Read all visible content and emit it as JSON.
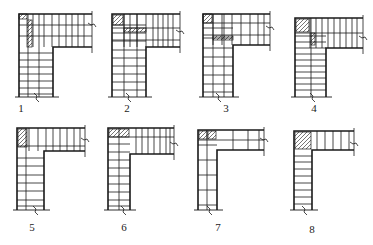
{
  "diagram": {
    "stroke_color": "#1a1a1a",
    "background": "#ffffff",
    "figures": [
      {
        "label": "1",
        "label_pos": [
          21,
          108
        ],
        "outer": {
          "x0": 19,
          "y0": 14,
          "right": 92,
          "stem_right": 53,
          "arm_bottom": 47,
          "bottom": 97
        },
        "wall_thickness": {
          "vertical": 34,
          "horizontal": 33
        },
        "arm_rows": [
          25,
          36
        ],
        "arm_cols": [
          33,
          44,
          52,
          59,
          66,
          72,
          78,
          84
        ],
        "stem_rows": [
          53,
          60,
          67,
          74,
          81,
          88,
          94
        ],
        "stem_cols": [
          28,
          39
        ],
        "hatch": [
          {
            "x": 19,
            "y": 14,
            "w": 8,
            "h": 5
          },
          {
            "x": 27,
            "y": 20,
            "w": 5,
            "h": 27
          }
        ],
        "break_bottom_x": 37,
        "break_right_y": 25
      },
      {
        "label": "2",
        "label_pos": [
          127,
          108
        ],
        "outer": {
          "x0": 112,
          "y0": 14,
          "right": 180,
          "stem_right": 146,
          "arm_bottom": 47,
          "bottom": 97
        },
        "wall_thickness": {
          "vertical": 34,
          "horizontal": 33
        },
        "arm_rows": [
          28,
          40
        ],
        "arm_cols": [
          124,
          130,
          137,
          146,
          153,
          158,
          163,
          168,
          173
        ],
        "stem_rows": [
          25,
          33,
          41,
          50,
          58,
          66,
          74,
          82,
          90
        ],
        "stem_cols": [
          124,
          137
        ],
        "hatch": [
          {
            "x": 113,
            "y": 15,
            "w": 10,
            "h": 10
          },
          {
            "x": 124,
            "y": 28,
            "w": 22,
            "h": 4
          }
        ],
        "break_bottom_x": 129,
        "break_right_y": 32
      },
      {
        "label": "3",
        "label_pos": [
          226,
          108
        ],
        "outer": {
          "x0": 203,
          "y0": 14,
          "right": 270,
          "stem_right": 233,
          "arm_bottom": 45,
          "bottom": 97
        },
        "wall_thickness": {
          "vertical": 30,
          "horizontal": 31
        },
        "arm_rows": [
          23,
          35
        ],
        "arm_cols": [
          213,
          222,
          232,
          241,
          250,
          258,
          264
        ],
        "stem_rows": [
          28,
          38,
          48,
          57,
          66,
          75,
          84,
          92
        ],
        "stem_cols": [
          213,
          224
        ],
        "hatch": [
          {
            "x": 203,
            "y": 14,
            "w": 9,
            "h": 9
          },
          {
            "x": 213,
            "y": 36,
            "w": 20,
            "h": 4
          }
        ],
        "break_bottom_x": 219,
        "break_right_y": 28
      },
      {
        "label": "4",
        "label_pos": [
          314,
          108
        ],
        "outer": {
          "x0": 295,
          "y0": 18,
          "right": 363,
          "stem_right": 326,
          "arm_bottom": 48,
          "bottom": 97
        },
        "wall_thickness": {
          "vertical": 31,
          "horizontal": 30
        },
        "arm_rows": [
          33
        ],
        "arm_cols": [
          310,
          316,
          322,
          328,
          334,
          340,
          346,
          352,
          357
        ],
        "stem_rows": [
          36,
          42,
          48,
          54,
          60,
          66,
          72,
          78,
          84,
          90
        ],
        "stem_cols": [
          311
        ],
        "hatch": [
          {
            "x": 296,
            "y": 19,
            "w": 13,
            "h": 13
          },
          {
            "x": 311,
            "y": 33,
            "w": 4,
            "h": 12
          }
        ],
        "break_bottom_x": 313,
        "break_right_y": 38
      },
      {
        "label": "5",
        "label_pos": [
          32,
          227
        ],
        "outer": {
          "x0": 17,
          "y0": 128,
          "right": 85,
          "stem_right": 44,
          "arm_bottom": 151,
          "bottom": 210
        },
        "wall_thickness": {
          "vertical": 27,
          "horizontal": 23
        },
        "arm_rows": [
          146
        ],
        "arm_cols": [
          29,
          38,
          46,
          53,
          60,
          67,
          74,
          80
        ],
        "stem_rows": [
          158,
          166,
          175,
          183,
          191,
          200,
          206
        ],
        "stem_cols": [
          26
        ],
        "hatch": [
          {
            "x": 18,
            "y": 129,
            "w": 9,
            "h": 18
          }
        ],
        "break_bottom_x": 36,
        "break_right_y": 140
      },
      {
        "label": "6",
        "label_pos": [
          124,
          227
        ],
        "outer": {
          "x0": 108,
          "y0": 128,
          "right": 174,
          "stem_right": 130,
          "arm_bottom": 154,
          "bottom": 210
        },
        "wall_thickness": {
          "vertical": 22,
          "horizontal": 26
        },
        "arm_rows": [
          137
        ],
        "arm_cols": [
          136,
          142,
          148,
          154,
          160,
          166,
          170
        ],
        "stem_rows": [
          144,
          152,
          160,
          168,
          176,
          184,
          192,
          200,
          206
        ],
        "stem_cols": [
          119
        ],
        "hatch": [
          {
            "x": 109,
            "y": 129,
            "w": 20,
            "h": 8
          }
        ],
        "break_bottom_x": 124,
        "break_right_y": 144
      },
      {
        "label": "7",
        "label_pos": [
          218,
          227
        ],
        "outer": {
          "x0": 198,
          "y0": 130,
          "right": 264,
          "stem_right": 217,
          "arm_bottom": 150,
          "bottom": 210
        },
        "wall_thickness": {
          "vertical": 19,
          "horizontal": 20
        },
        "arm_rows": [
          140
        ],
        "arm_cols": [
          233,
          248,
          259
        ],
        "stem_rows": [
          145,
          160,
          175,
          190,
          205
        ],
        "stem_cols": [
          207
        ],
        "hatch": [
          {
            "x": 199,
            "y": 131,
            "w": 8,
            "h": 8
          },
          {
            "x": 208,
            "y": 131,
            "w": 8,
            "h": 8
          }
        ],
        "break_bottom_x": 210,
        "break_right_y": 140
      },
      {
        "label": "8",
        "label_pos": [
          312,
          229
        ],
        "outer": {
          "x0": 294,
          "y0": 131,
          "right": 354,
          "stem_right": 312,
          "arm_bottom": 150,
          "bottom": 210
        },
        "wall_thickness": {
          "vertical": 18,
          "horizontal": 19
        },
        "arm_rows": [],
        "arm_cols": [
          317,
          325,
          333,
          341,
          349
        ],
        "stem_rows": [
          156,
          162,
          169,
          176,
          183,
          190,
          197,
          204
        ],
        "stem_cols": [],
        "hatch": [
          {
            "x": 295,
            "y": 132,
            "w": 16,
            "h": 17
          }
        ],
        "break_bottom_x": 305,
        "break_right_y": 144
      }
    ]
  }
}
